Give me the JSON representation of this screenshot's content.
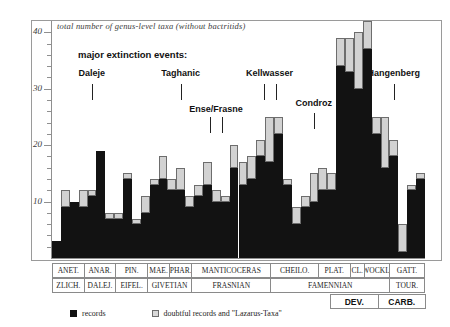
{
  "chart_data": {
    "type": "bar",
    "title": "total number of genus-level taxa (without bactritids)",
    "subtitle": "major extinction events:",
    "xlabel": "",
    "ylabel": "",
    "ylim": [
      0,
      42
    ],
    "y_major_ticks": [
      10,
      20,
      30,
      40
    ],
    "y_minor_tick_step": 2,
    "grid": false,
    "stacked": true,
    "legend": [
      {
        "key": "records",
        "label": "records",
        "color": "#121212"
      },
      {
        "key": "doubtful",
        "label": "doubtful records and \"Lazarus-Taxa\"",
        "color": "#d2d2d2"
      }
    ],
    "series": [
      {
        "name": "records",
        "values": [
          3,
          9,
          10,
          9,
          11,
          19,
          7,
          7,
          14,
          6,
          8,
          13,
          14,
          12,
          12,
          9,
          11,
          13,
          10,
          10,
          16,
          13,
          14,
          18,
          17,
          22,
          13,
          6,
          9,
          10,
          12,
          12,
          34,
          33,
          30,
          37,
          22,
          16,
          18,
          1,
          12,
          14
        ]
      },
      {
        "name": "doubtful",
        "values": [
          0,
          3,
          0,
          3,
          1,
          0,
          1,
          1,
          1,
          1,
          3,
          1,
          4,
          2,
          4,
          2,
          2,
          4,
          2,
          1,
          4,
          4,
          4,
          3,
          8,
          3,
          1,
          3,
          2,
          5,
          4,
          3,
          5,
          6,
          10,
          5,
          3,
          9,
          3,
          5,
          1,
          1
        ]
      }
    ],
    "annotations": [
      {
        "label": "Daleje",
        "bar_index": 4,
        "marks": 1
      },
      {
        "label": "Taghanic",
        "bar_index": 14,
        "marks": 1
      },
      {
        "label": "Ense/Frasne",
        "bar_index": 18,
        "marks": 2
      },
      {
        "label": "Kellwasser",
        "bar_index": 24,
        "marks": 2
      },
      {
        "label": "Condroz",
        "bar_index": 29,
        "marks": 1
      },
      {
        "label": "Hangenberg",
        "bar_index": 38,
        "marks": 1
      }
    ]
  },
  "stratigraphy": {
    "genus_zones": [
      {
        "label": "ANET.",
        "span": 2
      },
      {
        "label": "ANAR.",
        "span": 2
      },
      {
        "label": "PIN.",
        "span": 2
      },
      {
        "label": "MAE.",
        "span": 1.4
      },
      {
        "label": "PHAR.",
        "span": 1.4
      },
      {
        "label": "MANTICOCERAS",
        "span": 5
      },
      {
        "label": "CHEILO.",
        "span": 3
      },
      {
        "label": "PLAT.",
        "span": 2
      },
      {
        "label": "CL.",
        "span": 0.9
      },
      {
        "label": "WOCKL.",
        "span": 1.6
      },
      {
        "label": "GATT.",
        "span": 2.2
      }
    ],
    "stages": [
      {
        "label": "ZLICH.",
        "span": 2
      },
      {
        "label": "DALEJ.",
        "span": 2
      },
      {
        "label": "EIFEL.",
        "span": 2
      },
      {
        "label": "GIVETIAN",
        "span": 2.8
      },
      {
        "label": "FRASNIAN",
        "span": 5
      },
      {
        "label": "FAMENNIAN",
        "span": 7.5
      },
      {
        "label": "TOUR.",
        "span": 2.2
      }
    ],
    "systems": [
      {
        "label": "DEV.",
        "span": 1
      },
      {
        "label": "CARB.",
        "span": 1
      }
    ]
  }
}
